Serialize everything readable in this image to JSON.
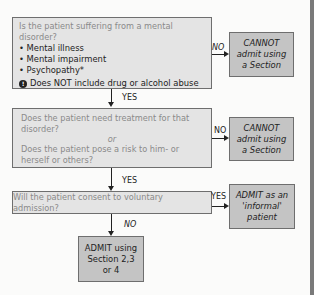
{
  "diagram": {
    "q1": {
      "question": "Is the patient suffering from a mental disorder?",
      "bullets": [
        "Mental illness",
        "Mental impairment",
        "Psychopathy*"
      ],
      "warning": "Does NOT include drug or alcohol abuse",
      "no_label": "NO",
      "yes_label": "YES"
    },
    "r1": {
      "line1": "CANNOT",
      "line2": "admit using",
      "line3": "a Section"
    },
    "q2": {
      "line1": "Does the patient need treatment for that disorder?",
      "or": "or",
      "line2": "Does the patient pose a risk to him- or herself or others?",
      "no_label": "NO",
      "yes_label": "YES"
    },
    "r2": {
      "line1": "CANNOT",
      "line2": "admit using",
      "line3": "a Section"
    },
    "q3": {
      "question": "Will the patient consent to voluntary admission?",
      "yes_label": "YES",
      "no_label": "NO"
    },
    "r3": {
      "line1": "ADMIT as an",
      "line2": "'informal'",
      "line3": "patient"
    },
    "r4": {
      "line1": "ADMIT using",
      "line2": "Section 2,3",
      "line3": "or 4"
    }
  }
}
